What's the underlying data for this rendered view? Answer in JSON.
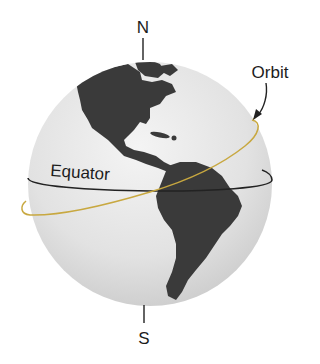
{
  "diagram": {
    "labels": {
      "north": "N",
      "south": "S",
      "orbit": "Orbit",
      "equator": "Equator"
    },
    "colors": {
      "orbit": "#c8a840",
      "equator": "#222222",
      "land": "#3a3a3a",
      "ocean": "#e4e4e4",
      "text": "#1c1c1c"
    }
  }
}
